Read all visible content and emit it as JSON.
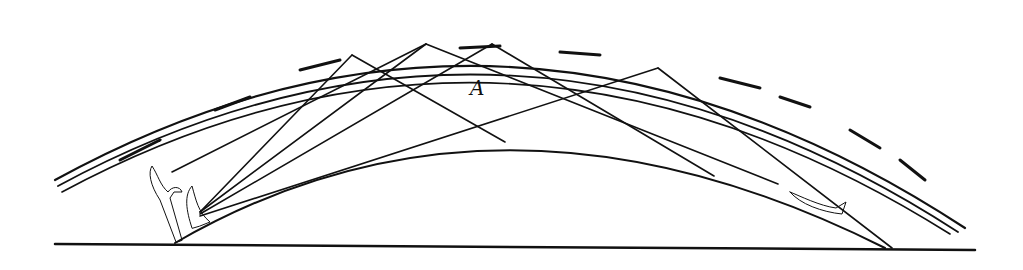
{
  "diagram": {
    "label": {
      "text": "A",
      "x": 470,
      "y": 78
    },
    "colors": {
      "ink": "#111111",
      "background": "#ffffff"
    },
    "ground": {
      "x1": 55,
      "y1": 244,
      "x2": 975,
      "y2": 250
    },
    "earth_curve": {
      "d": "M 175 243 Q 500 55 885 248"
    },
    "ionosphere_layers": [
      {
        "d": "M 55 180 Q 510 -70 965 228",
        "width": 2.2
      },
      {
        "d": "M 58 186 Q 510 -58 958 232",
        "width": 1.8
      },
      {
        "d": "M 62 192 Q 505 -46 950 234",
        "width": 1.6
      }
    ],
    "ionosphere_dashes": [
      {
        "d": "M 120 160 L 160 140",
        "width": 3
      },
      {
        "d": "M 215 110 L 250 97",
        "width": 3
      },
      {
        "d": "M 300 70 L 340 60",
        "width": 3
      },
      {
        "d": "M 460 48 L 500 46",
        "width": 3
      },
      {
        "d": "M 560 52 L 600 55",
        "width": 3
      },
      {
        "d": "M 720 78 L 760 88",
        "width": 3
      },
      {
        "d": "M 780 97 L 810 107",
        "width": 3
      },
      {
        "d": "M 850 130 L 880 148",
        "width": 3
      },
      {
        "d": "M 900 160 L 925 180",
        "width": 3
      }
    ],
    "transmitter": {
      "name": "transmitting-antenna",
      "d": "M 192 228 C 186 210 184 195 192 186 C 196 200 198 212 210 222 L 200 226 Z"
    },
    "receiver": {
      "name": "receiving-antenna",
      "d": "M 176 242 L 160 200 C 150 185 148 172 152 166 C 158 175 160 185 168 192 C 172 186 180 186 182 192 L 174 192 L 170 198 L 182 240 Z"
    },
    "aircraft": {
      "name": "aircraft",
      "d": "M 790 192 C 800 196 820 206 836 208 L 846 202 L 842 214 C 822 212 800 204 790 192 Z"
    },
    "rays": [
      {
        "id": "ray-1",
        "points": [
          [
            200,
            212
          ],
          [
            352,
            55
          ]
        ],
        "arrow_end": true
      },
      {
        "id": "ray-2",
        "points": [
          [
            352,
            55
          ],
          [
            505,
            142
          ]
        ],
        "arrow_end": true
      },
      {
        "id": "ray-3",
        "points": [
          [
            200,
            212
          ],
          [
            426,
            44
          ]
        ],
        "arrow_end": true
      },
      {
        "id": "ray-4",
        "points": [
          [
            426,
            44
          ],
          [
            172,
            172
          ]
        ],
        "arrow_end": true
      },
      {
        "id": "ray-5",
        "points": [
          [
            200,
            214
          ],
          [
            492,
            44
          ]
        ],
        "arrow_end": true
      },
      {
        "id": "ray-6",
        "points": [
          [
            492,
            44
          ],
          [
            714,
            176
          ]
        ],
        "arrow_end": true
      },
      {
        "id": "ray-7",
        "points": [
          [
            200,
            216
          ],
          [
            658,
            68
          ]
        ],
        "arrow_end": true
      },
      {
        "id": "ray-8",
        "points": [
          [
            658,
            68
          ],
          [
            892,
            248
          ]
        ],
        "arrow_end": true
      },
      {
        "id": "ray-9",
        "points": [
          [
            426,
            44
          ],
          [
            778,
            184
          ]
        ],
        "arrow_end": true
      }
    ]
  }
}
